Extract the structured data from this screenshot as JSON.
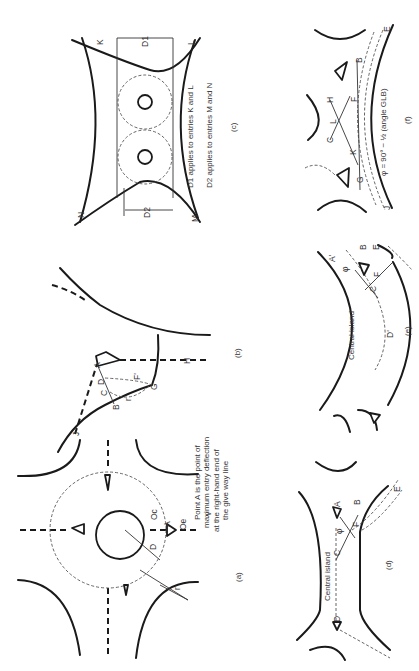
{
  "figure": {
    "orientation": "rotated 90 degrees counter-clockwise",
    "panels": [
      {
        "id": "a",
        "caption": "(a)",
        "labels": [
          "A",
          "D",
          "r",
          "Oc",
          "Oe",
          "v"
        ],
        "note_lines": [
          "Point A is the point of",
          "maximum entry deflection",
          "at the right-hand end of",
          "the give way line"
        ]
      },
      {
        "id": "b",
        "caption": "(b)",
        "labels": [
          "A",
          "B",
          "C",
          "D",
          "F'",
          "G",
          "H",
          "J",
          "r"
        ]
      },
      {
        "id": "c",
        "caption": "(c)",
        "labels": [
          "K",
          "L",
          "M",
          "N",
          "D1",
          "D2"
        ],
        "note_lines": [
          "D1 applies to entries K and L",
          "D2 applies to entries M and N"
        ]
      },
      {
        "id": "d",
        "caption": "(d)",
        "labels": [
          "A",
          "B",
          "C",
          "D",
          "E",
          "F",
          "φ"
        ],
        "island_label": "Central island"
      },
      {
        "id": "e",
        "caption": "(e)",
        "labels": [
          "A'",
          "B",
          "C",
          "D'",
          "E",
          "F",
          "φ"
        ],
        "island_label": "Central island"
      },
      {
        "id": "f",
        "caption": "(f)",
        "labels": [
          "B",
          "C",
          "E",
          "F",
          "G",
          "H",
          "J",
          "K",
          "L"
        ],
        "formula": "φ = 90° − ½ (angle GLB)"
      }
    ]
  }
}
